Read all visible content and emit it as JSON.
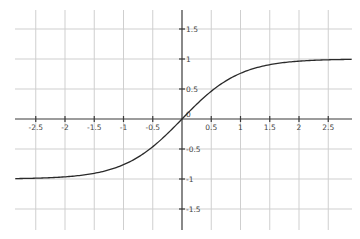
{
  "chart_data": {
    "type": "line",
    "title": "",
    "xlabel": "",
    "ylabel": "",
    "function": "tanh(x)",
    "xlim": [
      -2.85,
      2.9
    ],
    "ylim": [
      -1.85,
      1.8
    ],
    "grid": true,
    "legend": null,
    "x_ticks": [
      -2.5,
      -2,
      -1.5,
      -1,
      -0.5,
      0.5,
      1,
      1.5,
      2,
      2.5
    ],
    "x_tick_labels": [
      "-2.5",
      "-2",
      "-1.5",
      "-1",
      "-0.5",
      "0.5",
      "1",
      "1.5",
      "2",
      "2.5"
    ],
    "y_ticks": [
      1.5,
      1,
      0.5,
      -0.5,
      -1,
      -1.5
    ],
    "y_tick_labels": [
      "1.5",
      "1",
      "0.5",
      "-0.5",
      "-1",
      "-1.5"
    ],
    "origin_label": "0",
    "series": [
      {
        "name": "tanh",
        "x": [
          -2.85,
          -2.5,
          -2,
          -1.5,
          -1,
          -0.5,
          0,
          0.5,
          1,
          1.5,
          2,
          2.5,
          2.9
        ],
        "y": [
          -0.993,
          -0.987,
          -0.964,
          -0.905,
          -0.762,
          -0.462,
          0,
          0.462,
          0.762,
          0.905,
          0.964,
          0.987,
          0.994
        ]
      }
    ]
  },
  "layout": {
    "origin_px": [
      182,
      119
    ],
    "x_scale": 58.5,
    "y_scale": 60,
    "x_axis_px": [
      15,
      352
    ],
    "y_axis_px": [
      10,
      230
    ]
  }
}
